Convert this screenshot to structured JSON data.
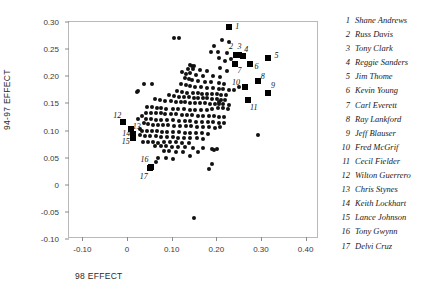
{
  "chart_data": {
    "type": "scatter",
    "title": "",
    "xlabel": "98 EFFECT",
    "ylabel": "94-97 EFFECT",
    "xlim": [
      -0.13,
      0.43
    ],
    "ylim": [
      -0.1,
      0.3
    ],
    "xticks": [
      "-0.10",
      "0",
      "0.10",
      "0.20",
      "0.30",
      "0.40"
    ],
    "xtick_values": [
      -0.1,
      0,
      0.1,
      0.2,
      0.3,
      0.4
    ],
    "yticks": [
      "0.30",
      "0.25",
      "0.20",
      "0.15",
      "0.10",
      "0.05",
      "0",
      "-0.05",
      "-0.10"
    ],
    "ytick_values": [
      0.3,
      0.25,
      0.2,
      0.15,
      0.1,
      0.05,
      0,
      -0.05,
      -0.1
    ],
    "grid": false,
    "legend_position": "right",
    "marker_color": "#111111",
    "highlight_color": "#000000",
    "labeled_points": [
      {
        "n": 1,
        "name": "Shane Andrews",
        "x": 0.2275,
        "y": 0.29,
        "lx": 0.247,
        "ly": 0.293
      },
      {
        "n": 2,
        "name": "Russ Davis",
        "x": 0.243,
        "y": 0.239,
        "lx": 0.233,
        "ly": 0.256
      },
      {
        "n": 3,
        "name": "Tony Clark",
        "x": 0.251,
        "y": 0.24,
        "lx": 0.252,
        "ly": 0.255
      },
      {
        "n": 4,
        "name": "Reggie Sanders",
        "x": 0.259,
        "y": 0.237,
        "lx": 0.267,
        "ly": 0.25
      },
      {
        "n": 5,
        "name": "Jim Thome",
        "x": 0.316,
        "y": 0.234,
        "lx": 0.335,
        "ly": 0.239
      },
      {
        "n": 6,
        "name": "Kevin Young",
        "x": 0.276,
        "y": 0.222,
        "lx": 0.29,
        "ly": 0.219
      },
      {
        "n": 7,
        "name": "Carl Everett",
        "x": 0.241,
        "y": 0.223,
        "lx": 0.252,
        "ly": 0.211
      },
      {
        "n": 8,
        "name": "Ray Lankford",
        "x": 0.293,
        "y": 0.1915,
        "lx": 0.304,
        "ly": 0.2
      },
      {
        "n": 9,
        "name": "Jeff Blauser",
        "x": 0.316,
        "y": 0.17,
        "lx": 0.327,
        "ly": 0.183
      },
      {
        "n": 10,
        "name": "Fred McGrif",
        "x": 0.264,
        "y": 0.1805,
        "lx": 0.244,
        "ly": 0.19
      },
      {
        "n": 11,
        "name": "Cecil Fielder",
        "x": 0.27,
        "y": 0.156,
        "lx": 0.284,
        "ly": 0.144
      },
      {
        "n": 12,
        "name": "Wilton Guerrero",
        "x": -0.008,
        "y": 0.1165,
        "lx": -0.022,
        "ly": 0.129
      },
      {
        "n": 13,
        "name": "Chris Stynes",
        "x": 0.0085,
        "y": 0.1025,
        "lx": 0.022,
        "ly": 0.108
      },
      {
        "n": 14,
        "name": "Keith Lockhart",
        "x": 0.0125,
        "y": 0.093,
        "lx": -0.002,
        "ly": 0.096
      },
      {
        "n": 15,
        "name": "Lance Johnson",
        "x": 0.013,
        "y": 0.0855,
        "lx": -0.003,
        "ly": 0.081
      },
      {
        "n": 16,
        "name": "Tony Gwynn",
        "x": 0.053,
        "y": 0.0325,
        "lx": 0.039,
        "ly": 0.048
      },
      {
        "n": 17,
        "name": "Delvi Cruz",
        "x": 0.052,
        "y": 0.031,
        "lx": 0.0375,
        "ly": 0.017
      }
    ],
    "points": [
      [
        0.105,
        0.27
      ],
      [
        0.1155,
        0.27
      ],
      [
        0.195,
        0.256
      ],
      [
        0.212,
        0.267
      ],
      [
        0.229,
        0.264
      ],
      [
        0.189,
        0.245
      ],
      [
        0.203,
        0.244
      ],
      [
        0.224,
        0.243
      ],
      [
        0.205,
        0.233
      ],
      [
        0.233,
        0.231
      ],
      [
        0.219,
        0.228
      ],
      [
        0.14,
        0.22
      ],
      [
        0.1455,
        0.219
      ],
      [
        0.151,
        0.2185
      ],
      [
        0.136,
        0.214
      ],
      [
        0.148,
        0.213
      ],
      [
        0.164,
        0.211
      ],
      [
        0.18,
        0.209
      ],
      [
        0.209,
        0.216
      ],
      [
        0.224,
        0.21
      ],
      [
        0.123,
        0.207
      ],
      [
        0.132,
        0.205
      ],
      [
        0.142,
        0.206
      ],
      [
        0.154,
        0.203
      ],
      [
        0.17,
        0.201
      ],
      [
        0.193,
        0.2
      ],
      [
        0.208,
        0.199
      ],
      [
        0.13,
        0.196
      ],
      [
        0.138,
        0.195
      ],
      [
        0.146,
        0.193
      ],
      [
        0.16,
        0.192
      ],
      [
        0.175,
        0.19
      ],
      [
        0.188,
        0.1895
      ],
      [
        0.206,
        0.188
      ],
      [
        0.217,
        0.186
      ],
      [
        0.121,
        0.185
      ],
      [
        0.039,
        0.186
      ],
      [
        0.056,
        0.185
      ],
      [
        0.131,
        0.183
      ],
      [
        0.14,
        0.182
      ],
      [
        0.152,
        0.181
      ],
      [
        0.165,
        0.1795
      ],
      [
        0.179,
        0.179
      ],
      [
        0.193,
        0.178
      ],
      [
        0.205,
        0.177
      ],
      [
        0.215,
        0.176
      ],
      [
        0.228,
        0.1755
      ],
      [
        0.239,
        0.1745
      ],
      [
        0.251,
        0.18
      ],
      [
        0.261,
        0.18
      ],
      [
        0.0255,
        0.173
      ],
      [
        0.113,
        0.172
      ],
      [
        0.124,
        0.171
      ],
      [
        0.135,
        0.17
      ],
      [
        0.147,
        0.169
      ],
      [
        0.158,
        0.169
      ],
      [
        0.169,
        0.168
      ],
      [
        0.18,
        0.1675
      ],
      [
        0.19,
        0.167
      ],
      [
        0.201,
        0.1665
      ],
      [
        0.211,
        0.166
      ],
      [
        0.222,
        0.165
      ],
      [
        0.023,
        0.1705
      ],
      [
        0.093,
        0.165
      ],
      [
        0.105,
        0.164
      ],
      [
        0.116,
        0.162
      ],
      [
        0.127,
        0.1615
      ],
      [
        0.138,
        0.161
      ],
      [
        0.149,
        0.1605
      ],
      [
        0.1595,
        0.16
      ],
      [
        0.17,
        0.1595
      ],
      [
        0.18,
        0.159
      ],
      [
        0.1905,
        0.158
      ],
      [
        0.201,
        0.1575
      ],
      [
        0.21,
        0.157
      ],
      [
        0.22,
        0.1565
      ],
      [
        0.205,
        0.152
      ],
      [
        0.062,
        0.158
      ],
      [
        0.073,
        0.156
      ],
      [
        0.086,
        0.1545
      ],
      [
        0.098,
        0.154
      ],
      [
        0.109,
        0.153
      ],
      [
        0.12,
        0.1525
      ],
      [
        0.13,
        0.152
      ],
      [
        0.141,
        0.1515
      ],
      [
        0.152,
        0.151
      ],
      [
        0.163,
        0.1505
      ],
      [
        0.174,
        0.15
      ],
      [
        0.185,
        0.1495
      ],
      [
        0.196,
        0.149
      ],
      [
        0.207,
        0.1485
      ],
      [
        0.216,
        0.148
      ],
      [
        0.228,
        0.147
      ],
      [
        0.045,
        0.143
      ],
      [
        0.056,
        0.1425
      ],
      [
        0.066,
        0.142
      ],
      [
        0.076,
        0.141
      ],
      [
        0.087,
        0.1405
      ],
      [
        0.103,
        0.14
      ],
      [
        0.115,
        0.1395
      ],
      [
        0.128,
        0.139
      ],
      [
        0.14,
        0.1385
      ],
      [
        0.153,
        0.138
      ],
      [
        0.165,
        0.1375
      ],
      [
        0.178,
        0.137
      ],
      [
        0.19,
        0.14
      ],
      [
        0.203,
        0.142
      ],
      [
        0.215,
        0.1415
      ],
      [
        0.227,
        0.1405
      ],
      [
        0.043,
        0.133
      ],
      [
        0.053,
        0.1325
      ],
      [
        0.064,
        0.132
      ],
      [
        0.075,
        0.1315
      ],
      [
        0.086,
        0.131
      ],
      [
        0.098,
        0.1305
      ],
      [
        0.11,
        0.13
      ],
      [
        0.122,
        0.129
      ],
      [
        0.134,
        0.1285
      ],
      [
        0.146,
        0.128
      ],
      [
        0.158,
        0.1275
      ],
      [
        0.17,
        0.127
      ],
      [
        0.183,
        0.1265
      ],
      [
        0.195,
        0.126
      ],
      [
        0.207,
        0.125
      ],
      [
        0.218,
        0.1245
      ],
      [
        0.0335,
        0.127
      ],
      [
        0.0245,
        0.121
      ],
      [
        0.042,
        0.1215
      ],
      [
        0.054,
        0.121
      ],
      [
        0.065,
        0.12
      ],
      [
        0.077,
        0.1195
      ],
      [
        0.09,
        0.119
      ],
      [
        0.103,
        0.1185
      ],
      [
        0.116,
        0.118
      ],
      [
        0.129,
        0.1175
      ],
      [
        0.142,
        0.117
      ],
      [
        0.155,
        0.1165
      ],
      [
        0.168,
        0.116
      ],
      [
        0.181,
        0.1155
      ],
      [
        0.193,
        0.115
      ],
      [
        0.206,
        0.1145
      ],
      [
        0.218,
        0.114
      ],
      [
        0.0385,
        0.113
      ],
      [
        0.047,
        0.112
      ],
      [
        0.058,
        0.111
      ],
      [
        0.069,
        0.1105
      ],
      [
        0.08,
        0.11
      ],
      [
        0.092,
        0.1095
      ],
      [
        0.105,
        0.109
      ],
      [
        0.118,
        0.1085
      ],
      [
        0.131,
        0.108
      ],
      [
        0.144,
        0.1075
      ],
      [
        0.157,
        0.107
      ],
      [
        0.17,
        0.1065
      ],
      [
        0.183,
        0.106
      ],
      [
        0.196,
        0.1055
      ],
      [
        0.209,
        0.1065
      ],
      [
        0.028,
        0.103
      ],
      [
        0.033,
        0.1
      ],
      [
        0.044,
        0.0995
      ],
      [
        0.055,
        0.099
      ],
      [
        0.066,
        0.0985
      ],
      [
        0.078,
        0.098
      ],
      [
        0.09,
        0.0975
      ],
      [
        0.103,
        0.097
      ],
      [
        0.116,
        0.0965
      ],
      [
        0.129,
        0.096
      ],
      [
        0.142,
        0.0955
      ],
      [
        0.155,
        0.095
      ],
      [
        0.168,
        0.0945
      ],
      [
        0.181,
        0.094
      ],
      [
        0.293,
        0.0925
      ],
      [
        0.03,
        0.091
      ],
      [
        0.041,
        0.09
      ],
      [
        0.052,
        0.0895
      ],
      [
        0.064,
        0.089
      ],
      [
        0.076,
        0.0885
      ],
      [
        0.089,
        0.088
      ],
      [
        0.102,
        0.0875
      ],
      [
        0.115,
        0.087
      ],
      [
        0.128,
        0.0865
      ],
      [
        0.142,
        0.086
      ],
      [
        0.156,
        0.0855
      ],
      [
        0.17,
        0.085
      ],
      [
        0.035,
        0.079
      ],
      [
        0.046,
        0.0785
      ],
      [
        0.058,
        0.078
      ],
      [
        0.07,
        0.0775
      ],
      [
        0.083,
        0.079
      ],
      [
        0.096,
        0.0785
      ],
      [
        0.11,
        0.078
      ],
      [
        0.124,
        0.0775
      ],
      [
        0.139,
        0.0765
      ],
      [
        0.063,
        0.072
      ],
      [
        0.075,
        0.0715
      ],
      [
        0.088,
        0.071
      ],
      [
        0.101,
        0.07
      ],
      [
        0.115,
        0.0695
      ],
      [
        0.13,
        0.069
      ],
      [
        0.148,
        0.068
      ],
      [
        0.17,
        0.067
      ],
      [
        0.19,
        0.066
      ],
      [
        0.201,
        0.066
      ],
      [
        0.082,
        0.062
      ],
      [
        0.095,
        0.0615
      ],
      [
        0.109,
        0.0605
      ],
      [
        0.125,
        0.06
      ],
      [
        0.158,
        0.061
      ],
      [
        0.195,
        0.0645
      ],
      [
        0.07,
        0.05
      ],
      [
        0.088,
        0.049
      ],
      [
        0.103,
        0.048
      ],
      [
        0.14,
        0.053
      ],
      [
        0.064,
        0.042
      ],
      [
        0.19,
        0.038
      ],
      [
        0.184,
        0.029
      ],
      [
        0.15,
        -0.062
      ]
    ]
  },
  "legend": {
    "entries": [
      {
        "num": "1",
        "name": "Shane Andrews"
      },
      {
        "num": "2",
        "name": "Russ Davis"
      },
      {
        "num": "3",
        "name": "Tony Clark"
      },
      {
        "num": "4",
        "name": "Reggie Sanders"
      },
      {
        "num": "5",
        "name": "Jim Thome"
      },
      {
        "num": "6",
        "name": "Kevin Young"
      },
      {
        "num": "7",
        "name": "Carl Everett"
      },
      {
        "num": "8",
        "name": "Ray Lankford"
      },
      {
        "num": "9",
        "name": "Jeff Blauser"
      },
      {
        "num": "10",
        "name": "Fred McGrif"
      },
      {
        "num": "11",
        "name": "Cecil Fielder"
      },
      {
        "num": "12",
        "name": "Wilton Guerrero"
      },
      {
        "num": "13",
        "name": "Chris Stynes"
      },
      {
        "num": "14",
        "name": "Keith Lockhart"
      },
      {
        "num": "15",
        "name": "Lance Johnson"
      },
      {
        "num": "16",
        "name": "Tony Gwynn"
      },
      {
        "num": "17",
        "name": "Delvi Cruz"
      }
    ]
  }
}
